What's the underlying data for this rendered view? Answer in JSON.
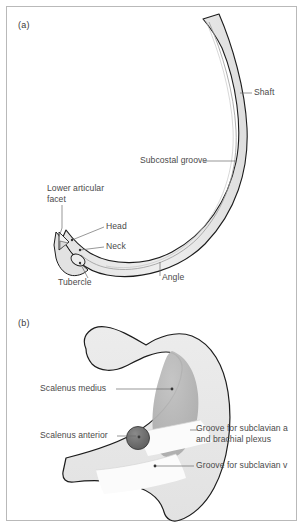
{
  "figure": {
    "panels": [
      {
        "id": "a",
        "letter": "(a)",
        "caption_subject": "typical rib, superior-posterior view",
        "labels": [
          {
            "name": "shaft",
            "text": "Shaft"
          },
          {
            "name": "subcostal-groove",
            "text": "Subcostal groove"
          },
          {
            "name": "lower-articular-facet",
            "text": "Lower articular facet"
          },
          {
            "name": "head",
            "text": "Head"
          },
          {
            "name": "neck",
            "text": "Neck"
          },
          {
            "name": "tubercle",
            "text": "Tubercle"
          },
          {
            "name": "angle",
            "text": "Angle"
          }
        ]
      },
      {
        "id": "b",
        "letter": "(b)",
        "caption_subject": "first rib, superior view with muscle attachments",
        "labels": [
          {
            "name": "scalenus-medius",
            "text": "Scalenus medius"
          },
          {
            "name": "scalenus-anterior",
            "text": "Scalenus anterior"
          },
          {
            "name": "groove-subclavian-artery",
            "text": "Groove for subclavian a and brachial plexus"
          },
          {
            "name": "groove-subclavian-vein",
            "text": "Groove for subclavian v"
          }
        ]
      }
    ]
  },
  "colors": {
    "page_background": "#ffffff",
    "frame_border": "#b9b9b9",
    "bone_fill": "#e8e8e8",
    "bone_fill_light": "#efefef",
    "bone_outline": "#1c1c1c",
    "groove_line": "#8c8c8c",
    "scalenus_medius_fill": "#b4b4b4",
    "scalenus_anterior_fill": "#6e6e6e",
    "groove_band_fill": "#fbfbfb",
    "label_text": "#4a4a4a",
    "leader_line": "#6b6b6b"
  }
}
